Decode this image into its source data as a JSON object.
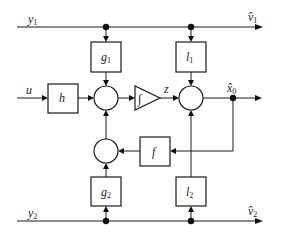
{
  "diagram": {
    "title": "",
    "signals": {
      "y1": {
        "base": "y",
        "sub": "1"
      },
      "y2": {
        "base": "y",
        "sub": "2"
      },
      "u": {
        "base": "u"
      },
      "z": {
        "base": "z"
      },
      "v1_hat": {
        "base": "v̂",
        "sub": "1"
      },
      "v2_hat": {
        "base": "v̂",
        "sub": "2"
      },
      "x0_hat": {
        "base": "x̂",
        "sub": "0"
      }
    },
    "blocks": {
      "g1": {
        "base": "g",
        "sub": "1"
      },
      "g2": {
        "base": "g",
        "sub": "2"
      },
      "l1": {
        "base": "l",
        "sub": "1"
      },
      "l2": {
        "base": "l",
        "sub": "2"
      },
      "h": {
        "base": "h"
      },
      "f": {
        "base": "f"
      },
      "integrator": {
        "symbol": "∫"
      }
    },
    "summing_junctions": [
      "sum-1",
      "sum-2",
      "sum-3"
    ],
    "connections": [
      {
        "from": "y1",
        "to": "g1"
      },
      {
        "from": "y1",
        "to": "l1"
      },
      {
        "from": "y1",
        "to": "v1_hat"
      },
      {
        "from": "u",
        "to": "h"
      },
      {
        "from": "h",
        "to": "sum-1"
      },
      {
        "from": "g1",
        "to": "sum-1"
      },
      {
        "from": "sum-3",
        "to": "sum-1"
      },
      {
        "from": "sum-1",
        "to": "integrator"
      },
      {
        "from": "integrator",
        "to": "sum-2",
        "label": "z"
      },
      {
        "from": "l1",
        "to": "sum-2"
      },
      {
        "from": "l2",
        "to": "sum-2"
      },
      {
        "from": "sum-2",
        "to": "x0_hat"
      },
      {
        "from": "x0_hat",
        "to": "f"
      },
      {
        "from": "f",
        "to": "sum-3"
      },
      {
        "from": "g2",
        "to": "sum-3"
      },
      {
        "from": "y2",
        "to": "g2"
      },
      {
        "from": "y2",
        "to": "l2"
      },
      {
        "from": "y2",
        "to": "v2_hat"
      }
    ]
  }
}
